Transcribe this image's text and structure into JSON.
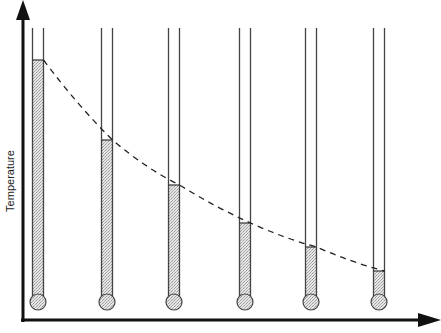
{
  "diagram": {
    "y_axis_label": "Temperature",
    "x_axis_label": "",
    "colors": {
      "axis": "#111111",
      "tube": "#444444",
      "mercury": "#cfcfcf",
      "curve": "#222222"
    },
    "thermometers": [
      {
        "x": 38,
        "level": 60
      },
      {
        "x": 107,
        "level": 140
      },
      {
        "x": 174,
        "level": 185
      },
      {
        "x": 245,
        "level": 223
      },
      {
        "x": 311,
        "level": 247
      },
      {
        "x": 379,
        "level": 271
      }
    ]
  }
}
